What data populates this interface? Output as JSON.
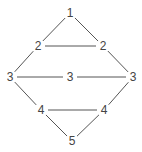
{
  "diagram": {
    "type": "graph",
    "nodes": [
      {
        "id": "n1",
        "label": "1",
        "x": 70,
        "y": 13
      },
      {
        "id": "n2a",
        "label": "2",
        "x": 38,
        "y": 46
      },
      {
        "id": "n2b",
        "label": "2",
        "x": 103,
        "y": 46
      },
      {
        "id": "n3a",
        "label": "3",
        "x": 10,
        "y": 77
      },
      {
        "id": "n3b",
        "label": "3",
        "x": 70,
        "y": 77
      },
      {
        "id": "n3c",
        "label": "3",
        "x": 133,
        "y": 77
      },
      {
        "id": "n4a",
        "label": "4",
        "x": 41,
        "y": 110
      },
      {
        "id": "n4b",
        "label": "4",
        "x": 104,
        "y": 110
      },
      {
        "id": "n5",
        "label": "5",
        "x": 72,
        "y": 141
      }
    ],
    "edges": [
      {
        "from": "n1",
        "to": "n2a"
      },
      {
        "from": "n1",
        "to": "n2b"
      },
      {
        "from": "n2a",
        "to": "n2b"
      },
      {
        "from": "n2a",
        "to": "n3a"
      },
      {
        "from": "n2b",
        "to": "n3c"
      },
      {
        "from": "n3a",
        "to": "n3b"
      },
      {
        "from": "n3b",
        "to": "n3c"
      },
      {
        "from": "n3a",
        "to": "n4a"
      },
      {
        "from": "n3c",
        "to": "n4b"
      },
      {
        "from": "n4a",
        "to": "n4b"
      },
      {
        "from": "n4a",
        "to": "n5"
      },
      {
        "from": "n4b",
        "to": "n5"
      }
    ],
    "colors": {
      "edge": "#555555",
      "label": "#444444",
      "background": "#ffffff"
    }
  }
}
